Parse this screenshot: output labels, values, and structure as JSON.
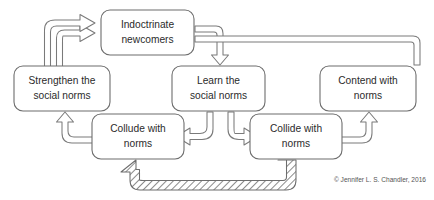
{
  "figure": {
    "credit": "© Jennifer L. S. Chandler, 2016",
    "background_color": "#ffffff",
    "node_stroke_color": "#6d6d6d",
    "arrow_stroke_color": "#7a7a7a",
    "text_color": "#2b2b2b"
  },
  "nodes": [
    {
      "id": "indoctrinate",
      "line1": "Indoctrinate",
      "line2": "newcomers",
      "x": 101,
      "y": 10,
      "w": 93,
      "h": 45
    },
    {
      "id": "strengthen",
      "line1": "Strengthen the",
      "line2": "social norms",
      "x": 14,
      "y": 66,
      "w": 96,
      "h": 45
    },
    {
      "id": "learn",
      "line1": "Learn the",
      "line2": "social norms",
      "x": 172,
      "y": 66,
      "w": 93,
      "h": 45
    },
    {
      "id": "contend",
      "line1": "Contend with",
      "line2": "norms",
      "x": 320,
      "y": 66,
      "w": 96,
      "h": 45
    },
    {
      "id": "collude",
      "line1": "Collude with",
      "line2": "norms",
      "x": 92,
      "y": 114,
      "w": 92,
      "h": 45
    },
    {
      "id": "collide",
      "line1": "Collide with",
      "line2": "norms",
      "x": 250,
      "y": 114,
      "w": 92,
      "h": 45
    }
  ],
  "connectors": [
    {
      "id": "indoctrinate-to-learn",
      "from": "indoctrinate",
      "to": "learn",
      "style": "outline-block-arrow"
    },
    {
      "id": "indoctrinate-to-contend",
      "from": "indoctrinate",
      "to": "contend",
      "style": "outline-block-arrow"
    },
    {
      "id": "learn-to-collude",
      "from": "learn",
      "to": "collude",
      "style": "outline-block-arrow"
    },
    {
      "id": "learn-to-collide",
      "from": "learn",
      "to": "collide",
      "style": "outline-block-arrow"
    },
    {
      "id": "collude-to-strengthen",
      "from": "collude",
      "to": "strengthen",
      "style": "outline-block-arrow"
    },
    {
      "id": "collide-to-contend",
      "from": "collide",
      "to": "contend",
      "style": "outline-block-arrow"
    },
    {
      "id": "strengthen-to-indoctrinate",
      "from": "strengthen",
      "to": "indoctrinate",
      "style": "outline-block-arrow"
    },
    {
      "id": "contend-to-indoctrinate",
      "from": "contend",
      "to": "indoctrinate",
      "style": "outline-block-arrow"
    },
    {
      "id": "collide-to-collude",
      "from": "collide",
      "to": "collude",
      "style": "hatched-block-arrow"
    }
  ]
}
